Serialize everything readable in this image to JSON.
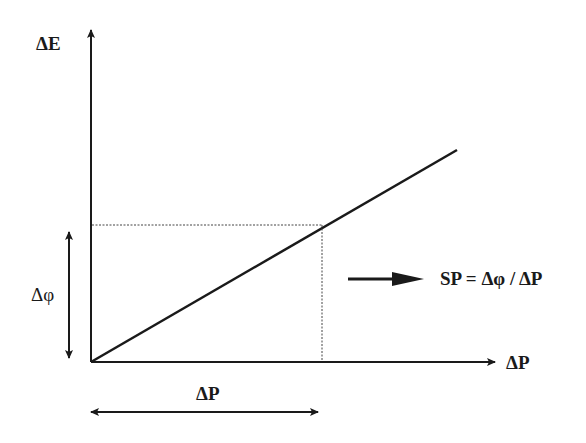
{
  "diagram": {
    "type": "line-graph-schematic",
    "y_axis_label": "ΔE",
    "x_axis_label": "ΔP",
    "delta_phi_label": "Δφ",
    "delta_p_label": "ΔP",
    "formula": "SP = Δφ / ΔP",
    "colors": {
      "ink": "#1a1a1a",
      "background": "#ffffff"
    }
  }
}
